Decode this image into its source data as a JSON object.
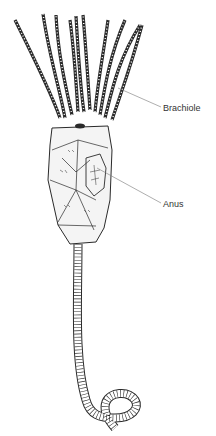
{
  "figure": {
    "labels": [
      {
        "id": "brachiole",
        "text": "Brachiole"
      },
      {
        "id": "anus",
        "text": "Anus"
      }
    ],
    "colors": {
      "background": "#ffffff",
      "ink": "#2a2a2a",
      "leader_line": "#777777",
      "label_text": "#333333"
    }
  }
}
